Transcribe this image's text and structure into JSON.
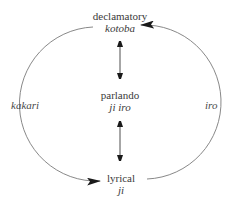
{
  "nodes": {
    "top": {
      "label": "declamatory",
      "sublabel": "kotoba"
    },
    "middle": {
      "label": "parlando",
      "sublabel": "ji iro"
    },
    "bottom": {
      "label": "lyrical",
      "sublabel": "ji"
    }
  },
  "arcs": {
    "left": {
      "label": "kakari",
      "direction": "top-to-bottom"
    },
    "right": {
      "label": "iro",
      "direction": "bottom-to-top"
    }
  },
  "vertical_arrows": [
    {
      "from": "top",
      "to": "middle",
      "type": "double-headed"
    },
    {
      "from": "middle",
      "to": "bottom",
      "type": "double-headed"
    }
  ],
  "colors": {
    "line": "#6e6e6e",
    "arrowhead": "#1a1a1a",
    "text": "#3a3a3a"
  }
}
